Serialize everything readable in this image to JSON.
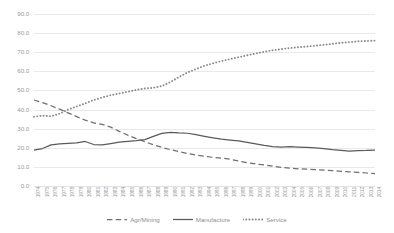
{
  "chart_data": {
    "type": "line",
    "title": "",
    "xlabel": "",
    "ylabel": "",
    "ylim": [
      0,
      90
    ],
    "ytick_step": 10,
    "grid": true,
    "legend_position": "bottom-center",
    "ytick_labels": [
      "0.0",
      "10.0",
      "20.0",
      "30.0",
      "40.0",
      "50.0",
      "60.0",
      "70.0",
      "80.0",
      "90.0"
    ],
    "categories": [
      "1974",
      "1975",
      "1976",
      "1977",
      "1978",
      "1979",
      "1980",
      "1981",
      "1982",
      "1983",
      "1984",
      "1985",
      "1986",
      "1987",
      "1988",
      "1989",
      "1990",
      "1991",
      "1992",
      "1993",
      "1994",
      "1995",
      "1996",
      "1997",
      "1998",
      "1999",
      "2000",
      "2001",
      "2002",
      "2003",
      "2004",
      "2005",
      "2006",
      "2007",
      "2008",
      "2009",
      "2010",
      "2011",
      "2012",
      "2013",
      "2014"
    ],
    "series": [
      {
        "name": "Agr/Mining",
        "style": "dashed",
        "color": "#6f6f73",
        "values": [
          45.0,
          43.6,
          42.0,
          40.2,
          38.3,
          36.3,
          34.5,
          33.0,
          32.2,
          30.8,
          28.6,
          26.6,
          24.8,
          23.2,
          21.6,
          20.2,
          19.0,
          18.0,
          17.0,
          16.2,
          15.6,
          15.0,
          14.6,
          14.0,
          13.1,
          12.2,
          11.5,
          11.0,
          10.4,
          9.7,
          9.3,
          9.0,
          8.8,
          8.6,
          8.3,
          8.0,
          7.7,
          7.4,
          7.1,
          6.8,
          6.5
        ]
      },
      {
        "name": "Manufacture",
        "style": "solid",
        "color": "#5a5a5e",
        "values": [
          18.8,
          19.6,
          21.5,
          22.0,
          22.3,
          22.6,
          23.3,
          21.7,
          21.5,
          22.2,
          23.0,
          23.4,
          23.8,
          24.3,
          26.0,
          27.5,
          28.1,
          27.8,
          27.6,
          26.9,
          26.0,
          25.2,
          24.5,
          24.0,
          23.6,
          22.8,
          22.0,
          21.2,
          20.6,
          20.4,
          20.6,
          20.4,
          20.2,
          20.0,
          19.6,
          19.0,
          18.6,
          18.2,
          18.5,
          18.6,
          18.8
        ]
      },
      {
        "name": "Service",
        "style": "dotted",
        "color": "#8a8a8e",
        "values": [
          36.2,
          36.8,
          36.5,
          37.8,
          40.0,
          41.6,
          43.2,
          45.0,
          46.3,
          47.5,
          48.4,
          49.3,
          50.3,
          51.0,
          51.4,
          52.3,
          54.4,
          57.0,
          59.4,
          61.2,
          62.9,
          64.2,
          65.4,
          66.4,
          67.4,
          68.4,
          69.3,
          70.2,
          71.0,
          71.6,
          72.2,
          72.6,
          73.0,
          73.4,
          73.9,
          74.4,
          74.9,
          75.3,
          75.7,
          75.9,
          76.1
        ]
      }
    ]
  },
  "legend": {
    "items": [
      {
        "label": "Agr/Mining"
      },
      {
        "label": "Manufacture"
      },
      {
        "label": "Service"
      }
    ]
  }
}
